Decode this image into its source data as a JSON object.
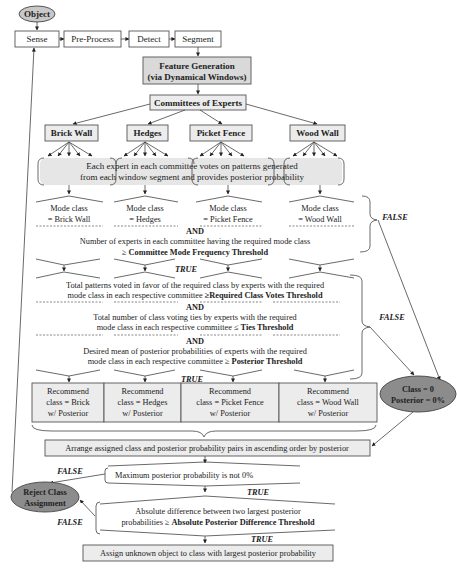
{
  "start": {
    "object_label": "Object"
  },
  "pipeline": {
    "steps": [
      "Sense",
      "Pre-Process",
      "Detect",
      "Segment"
    ]
  },
  "feature_generation": {
    "line1": "Feature Generation",
    "line2": "(via Dynamical Windows)"
  },
  "committees": {
    "label": "Committees of Experts",
    "items": [
      "Brick Wall",
      "Hedges",
      "Picket Fence",
      "Wood Wall"
    ]
  },
  "voting": {
    "line1": "Each expert in each committee votes on patterns generated",
    "line2": "from each window segment and provides posterior probability"
  },
  "mode_class": {
    "items": [
      {
        "line1": "Mode class",
        "line2": "= Brick Wall"
      },
      {
        "line1": "Mode class",
        "line2": "= Hedges"
      },
      {
        "line1": "Mode class",
        "line2": "= Picket Fence"
      },
      {
        "line1": "Mode class",
        "line2": "= Wood Wall"
      }
    ],
    "and_label": "AND",
    "condition_line1": "Number of experts in each committee having the required mode class",
    "condition_line2_prefix": "≥ ",
    "condition_line2_bold": "Committee Mode Frequency Threshold"
  },
  "class_votes": {
    "line1": "Total patterns voted in favor of the required class by experts with the required",
    "line2_prefix": "mode class in each respective committee ",
    "line2_bold": "≥Required Class Votes Threshold",
    "and1": "AND",
    "ties_line1": "Total number of class voting ties by experts with the required",
    "ties_line2_prefix": "mode class in each respective committee ≤ ",
    "ties_line2_bold": "Ties Threshold",
    "and2": "AND",
    "post_line1": "Desired mean of posterior probabilities of experts with the required",
    "post_line2_prefix": "mode class in each respective committee ≥ ",
    "post_line2_bold": "Posterior Threshold"
  },
  "recommend": {
    "items": [
      {
        "line1": "Recommend",
        "line2": "class = Brick",
        "line3": "w/ Posterior"
      },
      {
        "line1": "Recommend",
        "line2": "class = Hedges",
        "line3": "w/ Posterior"
      },
      {
        "line1": "Recommend",
        "line2": "class = Picket Fence",
        "line3": "w/ Posterior"
      },
      {
        "line1": "Recommend",
        "line2": "class = Wood Wall",
        "line3": "w/ Posterior"
      }
    ]
  },
  "class_zero": {
    "line1": "Class = 0",
    "line2": "Posterior = 0%"
  },
  "arrange": {
    "label": "Arrange assigned class and posterior probability pairs in ascending order by posterior"
  },
  "max_posterior": {
    "label": "Maximum posterior probability is not 0%"
  },
  "abs_diff": {
    "line1": "Absolute difference between two largest posterior",
    "line2_prefix": "probabilities  ≥  ",
    "line2_bold": "Absolute Posterior Difference Threshold"
  },
  "assign": {
    "label": "Assign unknown object to class with largest posterior probability"
  },
  "reject": {
    "line1": "Reject Class",
    "line2": "Assignment"
  },
  "labels": {
    "true": "TRUE",
    "false": "FALSE"
  }
}
